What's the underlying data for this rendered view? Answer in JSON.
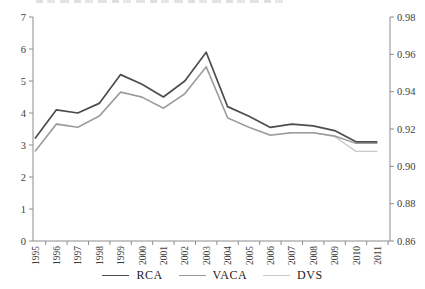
{
  "chart_data": {
    "type": "line",
    "title": "",
    "categories": [
      "1995",
      "1996",
      "1997",
      "1998",
      "1999",
      "2000",
      "2001",
      "2002",
      "2003",
      "2004",
      "2005",
      "2006",
      "2007",
      "2008",
      "2009",
      "2010",
      "2011"
    ],
    "series": [
      {
        "name": "RCA",
        "axis": "left",
        "color": "#4d4d4d",
        "stroke_width": 1.7,
        "values": [
          3.2,
          4.1,
          4.0,
          4.3,
          5.2,
          4.9,
          4.5,
          5.0,
          5.9,
          4.2,
          3.9,
          3.55,
          3.65,
          3.6,
          3.45,
          3.1,
          3.1
        ]
      },
      {
        "name": "VACA",
        "axis": "left",
        "color": "#9a9a9a",
        "stroke_width": 1.4,
        "values": [
          2.8,
          3.65,
          3.55,
          3.9,
          4.65,
          4.5,
          4.15,
          4.6,
          5.45,
          3.85,
          3.55,
          3.3,
          3.38,
          3.38,
          3.28,
          3.05,
          3.05
        ]
      },
      {
        "name": "DVS",
        "axis": "right",
        "color": "#c9c9c9",
        "stroke_width": 1.3,
        "values": [
          0.908,
          0.923,
          0.921,
          0.927,
          0.94,
          0.937,
          0.931,
          0.939,
          0.953,
          0.926,
          0.921,
          0.917,
          0.918,
          0.918,
          0.916,
          0.908,
          0.908
        ]
      }
    ],
    "left_axis": {
      "min": 0,
      "max": 7,
      "tick_labels": [
        "0",
        "1",
        "2",
        "3",
        "4",
        "5",
        "6",
        "7"
      ]
    },
    "right_axis": {
      "min": 0.86,
      "max": 0.98,
      "tick_labels": [
        "0.86",
        "0.88",
        "0.90",
        "0.92",
        "0.94",
        "0.96",
        "0.98"
      ]
    },
    "legend": [
      "RCA",
      "VACA",
      "DVS"
    ],
    "legend_position": "bottom",
    "grid": false,
    "axis_color": "#8c8c8c",
    "label_color": "#3d3d3d"
  }
}
